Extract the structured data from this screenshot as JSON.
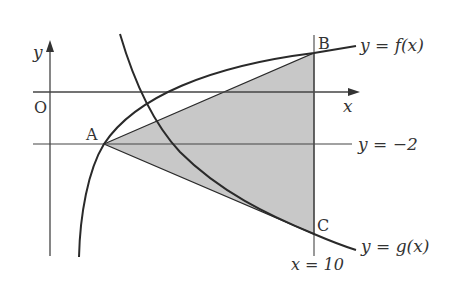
{
  "header_fragment": "",
  "diagram": {
    "title": "",
    "colors": {
      "stroke": "#2a2a2a",
      "axis": "#444444",
      "shade": "#c8c8c8",
      "text": "#333333"
    },
    "axes": {
      "x_label": "x",
      "y_label": "y",
      "origin_label": "O"
    },
    "points": {
      "A": "A",
      "B": "B",
      "C": "C"
    },
    "curves": {
      "f_label": "y = f(x)",
      "g_label": "y = g(x)"
    },
    "lines": {
      "horizontal_label": "y = −2",
      "vertical_label": "x = 10"
    },
    "shaded_region": "triangle ABC"
  }
}
